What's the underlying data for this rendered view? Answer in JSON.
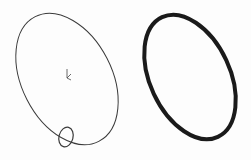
{
  "figure": {
    "left_panel": {
      "description": "sweep path ellipse with circular profile",
      "path_ellipse": {
        "cx": 67,
        "cy": 79,
        "rx": 45,
        "ry": 70,
        "rotate": -27,
        "stroke": "#3a3a3a",
        "stroke_width": 1
      },
      "profile_circle": {
        "cx": 66,
        "cy": 137,
        "rx": 7,
        "ry": 10,
        "rotate": 15,
        "stroke": "#3a3a3a",
        "stroke_width": 1.2
      },
      "origin_marker": {
        "x": 68,
        "y": 77
      }
    },
    "right_panel": {
      "description": "resulting swept ring (O-ring)",
      "ring_ellipse": {
        "cx": 190,
        "cy": 77,
        "rx": 40,
        "ry": 66,
        "rotate": -25,
        "stroke": "#1a1a1a",
        "stroke_width": 4
      }
    },
    "colors": {
      "background": "#fdfdfd",
      "line": "#3a3a3a",
      "ring": "#1a1a1a"
    }
  }
}
